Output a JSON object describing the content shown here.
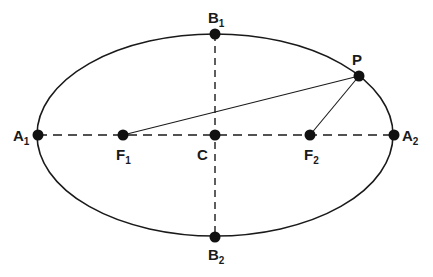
{
  "diagram": {
    "type": "ellipse-geometry",
    "colors": {
      "stroke": "#1a1a1a",
      "background": "#ffffff"
    },
    "ellipse": {
      "cx": 215,
      "cy": 135,
      "rx": 178,
      "ry": 101
    },
    "points": {
      "A1": {
        "label": "A",
        "sub": "1",
        "x": 38,
        "y": 135
      },
      "A2": {
        "label": "A",
        "sub": "2",
        "x": 394,
        "y": 135
      },
      "B1": {
        "label": "B",
        "sub": "1",
        "x": 215,
        "y": 34
      },
      "B2": {
        "label": "B",
        "sub": "2",
        "x": 215,
        "y": 237
      },
      "F1": {
        "label": "F",
        "sub": "1",
        "x": 123,
        "y": 135
      },
      "F2": {
        "label": "F",
        "sub": "2",
        "x": 310,
        "y": 135
      },
      "C": {
        "label": "C",
        "sub": "",
        "x": 215,
        "y": 135
      },
      "P": {
        "label": "P",
        "sub": "",
        "x": 359,
        "y": 76
      }
    },
    "segments": [
      {
        "from": "A1",
        "to": "A2",
        "style": "dashed",
        "name": "major-axis"
      },
      {
        "from": "B1",
        "to": "B2",
        "style": "dashed",
        "name": "minor-axis"
      },
      {
        "from": "F1",
        "to": "P",
        "style": "solid",
        "name": "focal-radius-1"
      },
      {
        "from": "F2",
        "to": "P",
        "style": "solid",
        "name": "focal-radius-2"
      }
    ]
  }
}
